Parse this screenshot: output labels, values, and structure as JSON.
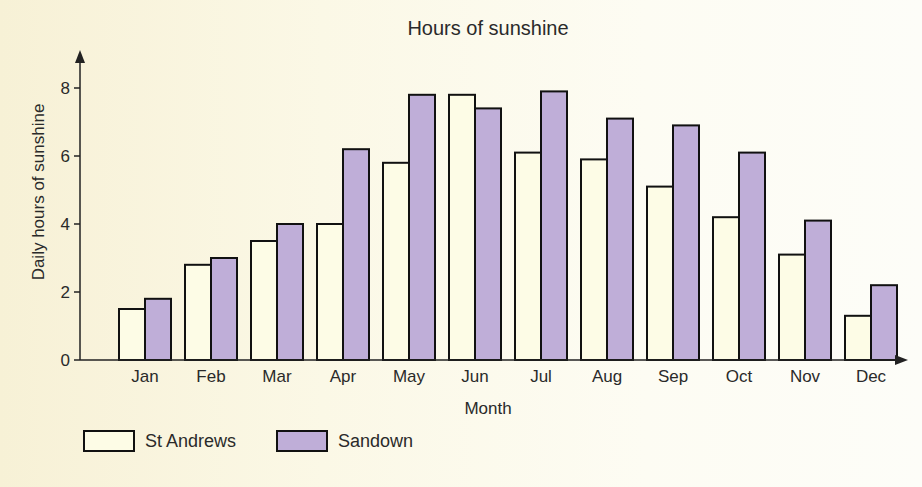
{
  "chart_data": {
    "type": "bar",
    "title": "Hours of sunshine",
    "xlabel": "Month",
    "ylabel": "Daily hours of sunshine",
    "categories": [
      "Jan",
      "Feb",
      "Mar",
      "Apr",
      "May",
      "Jun",
      "Jul",
      "Aug",
      "Sep",
      "Oct",
      "Nov",
      "Dec"
    ],
    "series": [
      {
        "name": "St Andrews",
        "color": "#fdfce6",
        "values": [
          1.5,
          2.8,
          3.5,
          4.0,
          5.8,
          7.8,
          6.1,
          5.9,
          5.1,
          4.2,
          3.1,
          1.3
        ]
      },
      {
        "name": "Sandown",
        "color": "#bfaed8",
        "values": [
          1.8,
          3.0,
          4.0,
          6.2,
          7.8,
          7.4,
          7.9,
          7.1,
          6.9,
          6.1,
          4.1,
          2.2
        ]
      }
    ],
    "yticks": [
      0,
      2,
      4,
      6,
      8
    ],
    "ylim": [
      0,
      8.5
    ],
    "grid": false,
    "legend_position": "bottom-left"
  },
  "legend": {
    "items": [
      {
        "label": "St Andrews",
        "color": "#fdfce6"
      },
      {
        "label": "Sandown",
        "color": "#bfaed8"
      }
    ]
  }
}
